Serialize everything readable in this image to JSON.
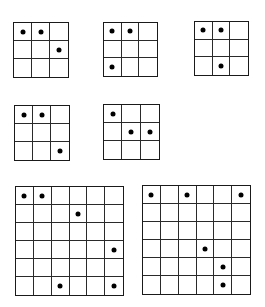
{
  "figure": {
    "line_color": "#1a1a1a",
    "dot_color": "#000000",
    "background": "#ffffff",
    "grids": [
      {
        "id": "grid-1",
        "rows": 3,
        "cols": 3,
        "x": 13,
        "y": 22,
        "w": 56,
        "h": 56,
        "dots": [
          [
            0,
            0
          ],
          [
            0,
            1
          ],
          [
            1,
            2
          ]
        ]
      },
      {
        "id": "grid-2",
        "rows": 3,
        "cols": 3,
        "x": 103,
        "y": 22,
        "w": 55,
        "h": 55,
        "dots": [
          [
            0,
            0
          ],
          [
            0,
            1
          ],
          [
            2,
            0
          ]
        ]
      },
      {
        "id": "grid-3",
        "rows": 3,
        "cols": 3,
        "x": 194,
        "y": 21,
        "w": 55,
        "h": 55,
        "dots": [
          [
            0,
            0
          ],
          [
            0,
            1
          ],
          [
            2,
            1
          ]
        ]
      },
      {
        "id": "grid-4",
        "rows": 3,
        "cols": 3,
        "x": 14,
        "y": 105,
        "w": 56,
        "h": 56,
        "dots": [
          [
            0,
            0
          ],
          [
            0,
            1
          ],
          [
            2,
            2
          ]
        ]
      },
      {
        "id": "grid-5",
        "rows": 3,
        "cols": 3,
        "x": 103,
        "y": 104,
        "w": 57,
        "h": 56,
        "dots": [
          [
            0,
            0
          ],
          [
            1,
            1
          ],
          [
            1,
            2
          ]
        ]
      },
      {
        "id": "grid-6",
        "rows": 6,
        "cols": 6,
        "x": 15,
        "y": 186,
        "w": 109,
        "h": 110,
        "dots": [
          [
            0,
            0
          ],
          [
            0,
            1
          ],
          [
            1,
            3
          ],
          [
            3,
            5
          ],
          [
            5,
            2
          ],
          [
            5,
            5
          ]
        ]
      },
      {
        "id": "grid-7",
        "rows": 6,
        "cols": 6,
        "x": 142,
        "y": 185,
        "w": 109,
        "h": 110,
        "dots": [
          [
            0,
            0
          ],
          [
            0,
            2
          ],
          [
            0,
            5
          ],
          [
            3,
            3
          ],
          [
            4,
            4
          ],
          [
            5,
            4
          ]
        ]
      }
    ]
  }
}
